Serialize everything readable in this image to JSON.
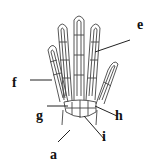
{
  "diagram": {
    "labels": [
      {
        "id": "a",
        "text": "a",
        "x": 50,
        "y": 148
      },
      {
        "id": "e",
        "text": "e",
        "x": 137,
        "y": 18
      },
      {
        "id": "f",
        "text": "f",
        "x": 12,
        "y": 76
      },
      {
        "id": "g",
        "text": "g",
        "x": 36,
        "y": 107
      },
      {
        "id": "h",
        "text": "h",
        "x": 115,
        "y": 107
      },
      {
        "id": "i",
        "text": "i",
        "x": 102,
        "y": 128
      }
    ],
    "colors": {
      "line": "#333333",
      "background": "#ffffff"
    }
  }
}
